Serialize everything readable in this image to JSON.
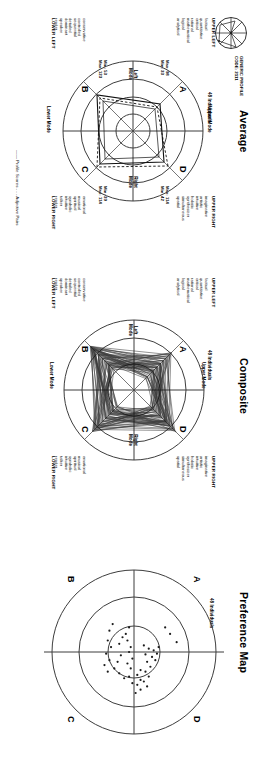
{
  "document": {
    "profile_code_label": "GENERIC PROFILE",
    "profile_code_value": "CODE: 2111",
    "legend": "—— Profile Scores  - - - Adjective Pairs",
    "logo_icon": "herrmann-circle-star-icon"
  },
  "panels": [
    {
      "id": "average",
      "title": "Average",
      "individuals": "48 Individuals",
      "quadrants": [
        "D",
        "A",
        "C",
        "B"
      ],
      "corner_heads": {
        "upper_right": "UPPER RIGHT",
        "upper_left": "UPPER LEFT",
        "lower_right": "LOWER RIGHT",
        "lower_left": "LOWER LEFT"
      },
      "modes": {
        "upper": "Upper Mode",
        "lower": "Lower Mode",
        "left": "Left\nMode",
        "right": "Right\nMode"
      },
      "words": {
        "upper_right": [
          "imaginative",
          "artistic",
          "intuitive",
          "holistic",
          "synthesizer",
          "simultaneous",
          "spatial"
        ],
        "upper_left": [
          "factual",
          "quantitative",
          "critical",
          "rational",
          "mathematical",
          "logical",
          "analytical"
        ],
        "lower_right": [
          "emotional",
          "musical",
          "spiritual",
          "symbolic",
          "intuitive",
          "talker",
          "reader"
        ],
        "lower_left": [
          "conservative",
          "controlled",
          "sequential",
          "detailed",
          "dominant",
          "speaker",
          "reader"
        ]
      },
      "minmax": {
        "D": [
          "Max: 114",
          "Min: 42"
        ],
        "A": [
          "Max: 98",
          "Min: 33"
        ],
        "C": [
          "Min: 39",
          "Max: 114"
        ],
        "B": [
          "Min: 53",
          "Max: 123"
        ]
      }
    },
    {
      "id": "composite",
      "title": "Composite",
      "individuals": "48 Individuals",
      "quadrants": [
        "D",
        "A",
        "C",
        "B"
      ],
      "corner_heads": {
        "upper_right": "UPPER RIGHT",
        "upper_left": "UPPER LEFT",
        "lower_right": "LOWER RIGHT",
        "lower_left": "LOWER LEFT"
      },
      "modes": {
        "upper": "Upper Mode",
        "lower": "Lower Mode",
        "left": "Left\nMode",
        "right": "Right\nMode"
      },
      "words": {
        "upper_right": [
          "imaginative",
          "artistic",
          "intuitive",
          "holistic",
          "synthesizer",
          "simultaneous",
          "spatial"
        ],
        "upper_left": [
          "factual",
          "quantitative",
          "critical",
          "rational",
          "mathematical",
          "logical",
          "analytical"
        ],
        "lower_right": [
          "emotional",
          "musical",
          "spiritual",
          "symbolic",
          "intuitive",
          "talker",
          "reader"
        ],
        "lower_left": [
          "conservative",
          "controlled",
          "sequential",
          "detailed",
          "dominant",
          "speaker",
          "reader"
        ]
      }
    },
    {
      "id": "preference_map",
      "title": "Preference Map",
      "individuals": "48 Individuals",
      "quadrants": [
        "D",
        "A",
        "C",
        "B"
      ]
    }
  ],
  "chart_data": [
    {
      "type": "line",
      "chart": "average-profile",
      "title": "Average",
      "subtitle": "48 Individuals",
      "categories": [
        "D (Upper Right)",
        "A (Upper Left)",
        "B (Lower Left)",
        "C (Lower Right)"
      ],
      "series": [
        {
          "name": "Profile Scores",
          "values": [
            78,
            66,
            88,
            77
          ]
        },
        {
          "name": "Adjective Pairs",
          "values": [
            85,
            60,
            82,
            80
          ]
        }
      ],
      "ranges": {
        "D": {
          "min": 42,
          "max": 114
        },
        "A": {
          "min": 33,
          "max": 98
        },
        "B": {
          "min": 53,
          "max": 123
        },
        "C": {
          "min": 39,
          "max": 114
        }
      },
      "rings": [
        33,
        67,
        100,
        133
      ],
      "grid": true,
      "legend": "bottom"
    },
    {
      "type": "line",
      "chart": "composite-profiles",
      "title": "Composite",
      "subtitle": "48 Individuals",
      "categories": [
        "D (Upper Right)",
        "A (Upper Left)",
        "B (Lower Left)",
        "C (Lower Right)"
      ],
      "n_profiles": 48,
      "series_summary": {
        "name": "48 overlaid individual profiles",
        "mean": [
          78,
          66,
          88,
          77
        ]
      },
      "rings": [
        33,
        67,
        100,
        133
      ],
      "grid": true
    },
    {
      "type": "scatter",
      "chart": "preference-map",
      "title": "Preference Map",
      "subtitle": "48 Individuals",
      "xlabel": "Left  ↔  Right",
      "ylabel": "Cerebral  ↔  Limbic",
      "xlim": [
        -100,
        100
      ],
      "ylim": [
        -100,
        100
      ],
      "rings": [
        30,
        66,
        100
      ],
      "points": [
        [
          -22,
          44
        ],
        [
          -30,
          38
        ],
        [
          -12,
          52
        ],
        [
          -6,
          30
        ],
        [
          2,
          28
        ],
        [
          -2,
          24
        ],
        [
          6,
          22
        ],
        [
          10,
          26
        ],
        [
          -4,
          18
        ],
        [
          3,
          14
        ],
        [
          -8,
          12
        ],
        [
          12,
          16
        ],
        [
          18,
          20
        ],
        [
          24,
          14
        ],
        [
          30,
          18
        ],
        [
          36,
          12
        ],
        [
          42,
          16
        ],
        [
          34,
          8
        ],
        [
          28,
          4
        ],
        [
          22,
          8
        ],
        [
          40,
          4
        ],
        [
          46,
          8
        ],
        [
          50,
          2
        ],
        [
          38,
          -2
        ],
        [
          30,
          -6
        ],
        [
          20,
          -4
        ],
        [
          14,
          -8
        ],
        [
          8,
          -2
        ],
        [
          0,
          -6
        ],
        [
          -6,
          -4
        ],
        [
          -14,
          -8
        ],
        [
          -22,
          -10
        ],
        [
          -30,
          -6
        ],
        [
          -18,
          -14
        ],
        [
          -10,
          -18
        ],
        [
          4,
          -16
        ],
        [
          12,
          -20
        ],
        [
          20,
          -24
        ],
        [
          26,
          -18
        ],
        [
          32,
          -12
        ],
        [
          10,
          -30
        ],
        [
          2,
          -34
        ],
        [
          -6,
          -28
        ],
        [
          -14,
          -32
        ],
        [
          -26,
          -30
        ],
        [
          -34,
          -26
        ],
        [
          16,
          -36
        ],
        [
          24,
          -32
        ]
      ]
    }
  ]
}
